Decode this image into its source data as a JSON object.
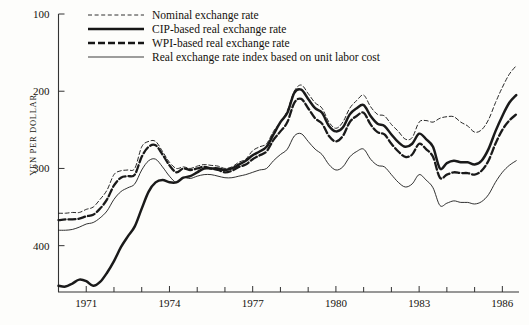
{
  "figure": {
    "background_color": "#fdfdfb",
    "line_color": "#1a1a1a"
  },
  "axes": {
    "ylabel": "YEN PER DOLLAR",
    "y_ticks": [
      "100",
      "200",
      "300",
      "400"
    ],
    "y_tick_values": [
      100,
      200,
      300,
      400
    ],
    "y_inverted": true,
    "x_ticks": [
      "1971",
      "1974",
      "1977",
      "1980",
      "1983",
      "1986"
    ],
    "x_tick_values": [
      1971,
      1974,
      1977,
      1980,
      1983,
      1986
    ],
    "x_minor_every": 1,
    "grid": false
  },
  "legend": {
    "position": "top-left-inside",
    "entries": [
      {
        "label": "Nominal exchange rate",
        "style": "fine-dashed",
        "key": "nominal"
      },
      {
        "label": "CIP-based real exchange rate",
        "style": "thick-solid",
        "key": "cip"
      },
      {
        "label": "WPI-based real exchange rate",
        "style": "thick-dashed",
        "key": "wpi"
      },
      {
        "label": "Real exchange rate index based on unit labor cost",
        "style": "thin-solid",
        "key": "ulc"
      }
    ]
  },
  "chart_data": {
    "type": "line",
    "title": "",
    "xlabel": "",
    "ylabel": "YEN PER DOLLAR",
    "xlim": [
      1970.0,
      1986.6
    ],
    "ylim": [
      100,
      460
    ],
    "y_axis_inverted": true,
    "grid": false,
    "legend_position": "upper left",
    "x": [
      1970.0,
      1970.25,
      1970.5,
      1970.75,
      1971.0,
      1971.25,
      1971.5,
      1971.75,
      1972.0,
      1972.25,
      1972.5,
      1972.75,
      1973.0,
      1973.25,
      1973.5,
      1973.75,
      1974.0,
      1974.25,
      1974.5,
      1974.75,
      1975.0,
      1975.25,
      1975.5,
      1975.75,
      1976.0,
      1976.25,
      1976.5,
      1976.75,
      1977.0,
      1977.25,
      1977.5,
      1977.75,
      1978.0,
      1978.25,
      1978.5,
      1978.75,
      1979.0,
      1979.25,
      1979.5,
      1979.75,
      1980.0,
      1980.25,
      1980.5,
      1980.75,
      1981.0,
      1981.25,
      1981.5,
      1981.75,
      1982.0,
      1982.25,
      1982.5,
      1982.75,
      1983.0,
      1983.25,
      1983.5,
      1983.75,
      1984.0,
      1984.25,
      1984.5,
      1984.75,
      1985.0,
      1985.25,
      1985.5,
      1985.75,
      1986.0,
      1986.25,
      1986.5
    ],
    "series": [
      {
        "name": "Nominal exchange rate",
        "key": "nominal",
        "style": "fine-dashed",
        "values": [
          358,
          358,
          357,
          357,
          353,
          350,
          340,
          328,
          308,
          303,
          302,
          300,
          272,
          265,
          265,
          278,
          292,
          300,
          298,
          300,
          297,
          295,
          296,
          297,
          300,
          298,
          292,
          288,
          277,
          272,
          268,
          252,
          240,
          225,
          200,
          192,
          203,
          215,
          222,
          240,
          248,
          240,
          222,
          212,
          205,
          220,
          230,
          232,
          243,
          252,
          262,
          260,
          240,
          238,
          240,
          235,
          233,
          233,
          240,
          245,
          253,
          250,
          237,
          215,
          195,
          178,
          167
        ]
      },
      {
        "name": "CIP-based real exchange rate",
        "key": "cip",
        "style": "thick-solid",
        "values": [
          452,
          453,
          449,
          444,
          446,
          452,
          447,
          435,
          420,
          402,
          388,
          375,
          352,
          330,
          318,
          315,
          318,
          318,
          312,
          310,
          305,
          300,
          300,
          300,
          302,
          300,
          295,
          290,
          283,
          278,
          272,
          256,
          240,
          228,
          202,
          198,
          210,
          222,
          228,
          245,
          252,
          247,
          230,
          222,
          218,
          232,
          242,
          245,
          256,
          266,
          272,
          268,
          255,
          262,
          272,
          300,
          293,
          290,
          292,
          292,
          295,
          290,
          275,
          252,
          232,
          215,
          205
        ]
      },
      {
        "name": "WPI-based real exchange rate",
        "key": "wpi",
        "style": "thick-dashed",
        "values": [
          367,
          366,
          366,
          365,
          362,
          360,
          352,
          340,
          322,
          312,
          310,
          308,
          285,
          272,
          270,
          282,
          296,
          305,
          300,
          302,
          300,
          298,
          300,
          302,
          305,
          303,
          298,
          295,
          288,
          283,
          278,
          263,
          252,
          240,
          215,
          210,
          222,
          235,
          242,
          258,
          265,
          258,
          240,
          232,
          228,
          243,
          253,
          256,
          268,
          278,
          285,
          282,
          268,
          275,
          285,
          312,
          308,
          305,
          306,
          306,
          308,
          303,
          290,
          268,
          250,
          238,
          230
        ]
      },
      {
        "name": "Real exchange rate index based on unit labor cost",
        "key": "ulc",
        "style": "thin-solid",
        "values": [
          380,
          380,
          379,
          376,
          372,
          370,
          364,
          355,
          340,
          330,
          325,
          320,
          302,
          290,
          288,
          298,
          310,
          318,
          312,
          313,
          310,
          308,
          308,
          310,
          312,
          312,
          310,
          308,
          305,
          302,
          300,
          290,
          282,
          275,
          258,
          255,
          265,
          275,
          282,
          295,
          302,
          298,
          285,
          278,
          275,
          288,
          296,
          298,
          308,
          318,
          324,
          320,
          308,
          315,
          325,
          348,
          345,
          342,
          344,
          344,
          346,
          343,
          334,
          318,
          305,
          296,
          290
        ]
      }
    ]
  }
}
